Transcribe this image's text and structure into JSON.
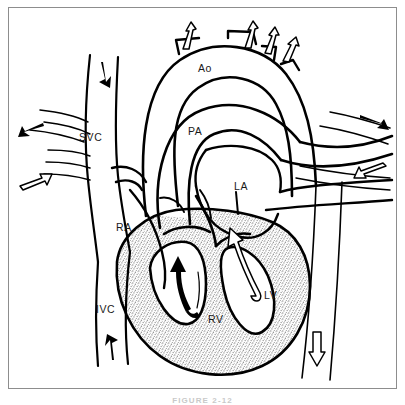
{
  "figure": {
    "caption": "FIGURE 2-12",
    "background_color": "#ffffff",
    "line_color": "#000000",
    "frame_color": "#8d8d8d",
    "myocardium_fill": "stipple-gray",
    "myocardium_color": "#b4b4b4"
  },
  "labels": [
    {
      "id": "ao",
      "text": "Ao",
      "full_name": "Aorta",
      "x": 198,
      "y": 62
    },
    {
      "id": "svc",
      "text": "SVC",
      "full_name": "Superior vena cava",
      "x": 79,
      "y": 131
    },
    {
      "id": "pa",
      "text": "PA",
      "full_name": "Pulmonary artery",
      "x": 188,
      "y": 125
    },
    {
      "id": "la",
      "text": "LA",
      "full_name": "Left atrium",
      "x": 234,
      "y": 180
    },
    {
      "id": "ra",
      "text": "RA",
      "full_name": "Right atrium",
      "x": 116,
      "y": 221
    },
    {
      "id": "lv",
      "text": "LV",
      "full_name": "Left ventricle",
      "x": 264,
      "y": 289
    },
    {
      "id": "rv",
      "text": "RV",
      "full_name": "Right ventricle",
      "x": 208,
      "y": 313
    },
    {
      "id": "ivc",
      "text": "IVC",
      "full_name": "Inferior vena cava",
      "x": 96,
      "y": 303
    }
  ],
  "flow_arrows": [
    {
      "id": "arch-branch-1",
      "style": "hollow",
      "direction": "up",
      "region": "aortic arch branch"
    },
    {
      "id": "arch-branch-2",
      "style": "hollow",
      "direction": "up",
      "region": "aortic arch branch"
    },
    {
      "id": "arch-branch-3",
      "style": "hollow",
      "direction": "up",
      "region": "aortic arch branch"
    },
    {
      "id": "arch-branch-4",
      "style": "hollow",
      "direction": "up",
      "region": "aortic arch branch"
    },
    {
      "id": "svc-inflow",
      "style": "solid",
      "direction": "down",
      "region": "superior vena cava"
    },
    {
      "id": "ivc-inflow",
      "style": "solid",
      "direction": "up",
      "region": "inferior vena cava"
    },
    {
      "id": "left-vein-return",
      "style": "solid",
      "direction": "left",
      "region": "left pulmonary vessels"
    },
    {
      "id": "left-artery-out",
      "style": "hollow",
      "direction": "right",
      "region": "left pulmonary vessels"
    },
    {
      "id": "right-vein-return",
      "style": "solid",
      "direction": "right",
      "region": "right pulmonary vessels"
    },
    {
      "id": "right-artery-out",
      "style": "hollow",
      "direction": "left",
      "region": "right pulmonary vessels"
    },
    {
      "id": "rv-outflow",
      "style": "solid",
      "direction": "up",
      "region": "right ventricle"
    },
    {
      "id": "lv-outflow",
      "style": "hollow",
      "direction": "up",
      "region": "left ventricle"
    },
    {
      "id": "descending-aorta",
      "style": "hollow",
      "direction": "down",
      "region": "descending aorta"
    }
  ]
}
